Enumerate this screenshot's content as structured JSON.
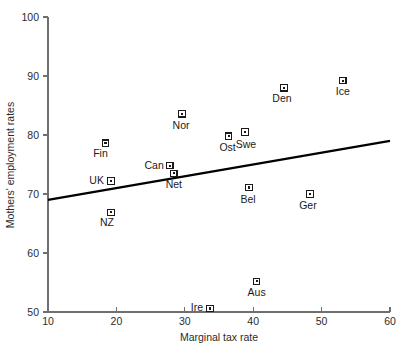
{
  "chart_data": {
    "type": "scatter",
    "title": "",
    "xlabel": "Marginal tax rate",
    "ylabel": "Mothers' employment rates",
    "xlim": [
      10,
      60
    ],
    "ylim": [
      50,
      100
    ],
    "xticks": [
      10,
      20,
      30,
      40,
      50,
      60
    ],
    "yticks": [
      50,
      60,
      70,
      80,
      90,
      100
    ],
    "grid": false,
    "legend": "none",
    "points": [
      {
        "label": "Fin",
        "x": 18.4,
        "y": 78.6,
        "label_dx": -5,
        "label_dy": 14,
        "label_anchor": "middle"
      },
      {
        "label": "UK",
        "x": 19.2,
        "y": 72.2,
        "label_dx": -7,
        "label_dy": 3,
        "label_anchor": "end"
      },
      {
        "label": "NZ",
        "x": 19.2,
        "y": 66.9,
        "label_dx": -4,
        "label_dy": 14,
        "label_anchor": "middle"
      },
      {
        "label": "Can",
        "x": 27.8,
        "y": 74.8,
        "label_dx": -6,
        "label_dy": 3,
        "label_anchor": "end"
      },
      {
        "label": "Net",
        "x": 28.4,
        "y": 73.5,
        "label_dx": 0,
        "label_dy": 15,
        "label_anchor": "middle"
      },
      {
        "label": "Nor",
        "x": 29.6,
        "y": 83.6,
        "label_dx": -1,
        "label_dy": 15,
        "label_anchor": "middle"
      },
      {
        "label": "Ost",
        "x": 36.4,
        "y": 79.8,
        "label_dx": -1,
        "label_dy": 15,
        "label_anchor": "middle"
      },
      {
        "label": "Swe",
        "x": 38.8,
        "y": 80.5,
        "label_dx": 1,
        "label_dy": 16,
        "label_anchor": "middle"
      },
      {
        "label": "Bel",
        "x": 39.4,
        "y": 71.1,
        "label_dx": -1,
        "label_dy": 15,
        "label_anchor": "middle"
      },
      {
        "label": "Den",
        "x": 44.5,
        "y": 88.0,
        "label_dx": -2,
        "label_dy": 14,
        "label_anchor": "middle"
      },
      {
        "label": "Ger",
        "x": 48.3,
        "y": 70.0,
        "label_dx": -2,
        "label_dy": 15,
        "label_anchor": "middle"
      },
      {
        "label": "Ice",
        "x": 53.1,
        "y": 89.2,
        "label_dx": 0,
        "label_dy": 14,
        "label_anchor": "middle"
      },
      {
        "label": "Aus",
        "x": 40.5,
        "y": 55.2,
        "label_dx": 0,
        "label_dy": 15,
        "label_anchor": "middle"
      },
      {
        "label": "Ire",
        "x": 33.7,
        "y": 50.6,
        "label_dx": -7,
        "label_dy": 3,
        "label_anchor": "end"
      }
    ],
    "trend_line": {
      "x0": 10,
      "y0": 69.0,
      "x1": 60,
      "y1": 79.0
    }
  },
  "caption": {
    "text": ""
  }
}
